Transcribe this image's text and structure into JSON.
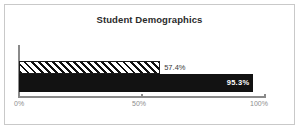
{
  "frame": {
    "border_color": "#c9c9c9",
    "background_color": "#ffffff"
  },
  "chart_data": {
    "type": "bar",
    "orientation": "horizontal",
    "title": "Student Demographics",
    "xlabel": "",
    "ylabel": "",
    "categories": [
      "Series 1",
      "Series 2"
    ],
    "values": [
      57.4,
      95.3
    ],
    "value_labels": [
      "57.4%",
      "95.3%"
    ],
    "xlim": [
      0,
      100
    ],
    "x_ticks": [
      0,
      50,
      100
    ],
    "x_tick_labels": [
      "0%",
      "50%",
      "100%"
    ],
    "grid": false,
    "legend": false,
    "bar_styles": [
      {
        "name": "hatched-bar",
        "fill": "#ffffff",
        "edge": "#1a1a1a",
        "hatch": "diagonal-forward",
        "label_position": "outside",
        "label_color": "#3a3a3a"
      },
      {
        "name": "solid-bar",
        "fill": "#121212",
        "edge": "#121212",
        "hatch": "none",
        "label_position": "inside",
        "label_color": "#ffffff"
      }
    ],
    "axis_color": "#8a8a8a",
    "title_color": "#2b2b2b",
    "tick_label_color": "#8d8d8d"
  }
}
